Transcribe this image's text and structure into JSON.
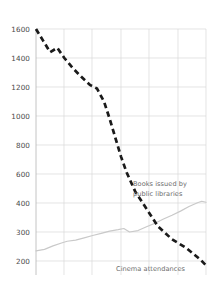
{
  "chart_data": {
    "type": "line",
    "title": "",
    "subtitle": "",
    "xlabel": "",
    "ylabel": "",
    "grid": true,
    "legend_position": "inline-annotation",
    "y_axis": {
      "tick_labels": [
        "1600",
        "1400",
        "1200",
        "1000",
        "800",
        "600",
        "400",
        "300",
        "200"
      ],
      "tick_values": [
        1600,
        1400,
        1200,
        1000,
        800,
        600,
        400,
        300,
        200
      ],
      "scale_note": "broken scale: 200-unit steps above 400, 100-unit steps below 400",
      "ylim": [
        150,
        1700
      ]
    },
    "x_axis": {
      "tick_labels": [
        "",
        "",
        "",
        "",
        "",
        "",
        ""
      ],
      "gridline_count": 7,
      "xlim": [
        0,
        6
      ]
    },
    "series": [
      {
        "name": "Cinema attendances",
        "style": "dashed",
        "color": "#1a1a1a",
        "width": 2.6,
        "x": [
          0.0,
          0.25,
          0.5,
          0.75,
          1.0,
          1.3,
          1.6,
          1.9,
          2.15,
          2.4,
          2.6,
          2.8,
          3.0,
          3.2,
          3.5,
          3.9,
          4.3,
          4.8,
          5.3,
          5.8,
          6.0
        ],
        "values": [
          1600,
          1520,
          1440,
          1470,
          1400,
          1330,
          1270,
          1215,
          1190,
          1100,
          980,
          850,
          720,
          610,
          480,
          380,
          320,
          275,
          245,
          205,
          185
        ]
      },
      {
        "name": "Books issued by public libraries",
        "style": "solid",
        "color": "#c9c9c9",
        "width": 1.2,
        "x": [
          0.0,
          0.3,
          0.6,
          0.9,
          1.1,
          1.4,
          1.7,
          2.0,
          2.3,
          2.6,
          2.9,
          3.1,
          3.3,
          3.6,
          3.9,
          4.2,
          4.5,
          4.8,
          5.1,
          5.4,
          5.7,
          5.85,
          6.0
        ],
        "values": [
          235,
          240,
          252,
          262,
          268,
          272,
          280,
          288,
          295,
          303,
          308,
          312,
          300,
          305,
          318,
          330,
          345,
          358,
          372,
          388,
          402,
          412,
          405
        ]
      }
    ],
    "annotations": [
      {
        "name": "books-label",
        "text_line1": "Books issued by",
        "text_line2": "public libraries"
      },
      {
        "name": "cinema-label",
        "text_line1": "Cinema attendances",
        "text_line2": ""
      }
    ],
    "colors": {
      "cinema": "#1a1a1a",
      "books": "#c9c9c9",
      "grid": "#d8d8d8",
      "axis": "#b0b0b0",
      "tick_text": "#4a4a4a",
      "annotation_text": "#6d6d6d",
      "background": "#ffffff"
    }
  }
}
